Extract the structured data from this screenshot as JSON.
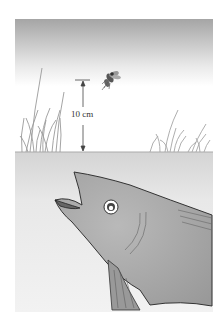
{
  "figure": {
    "height_label": "10 cm",
    "colors": {
      "sky_top": "#a9a9a9",
      "sky_bottom": "#ffffff",
      "water": "#e4e4e4",
      "water_line": "#b0b0b0",
      "fish_body": "#a8a8a8",
      "fish_outline": "#333333",
      "grass": "#9a9a9a"
    }
  }
}
